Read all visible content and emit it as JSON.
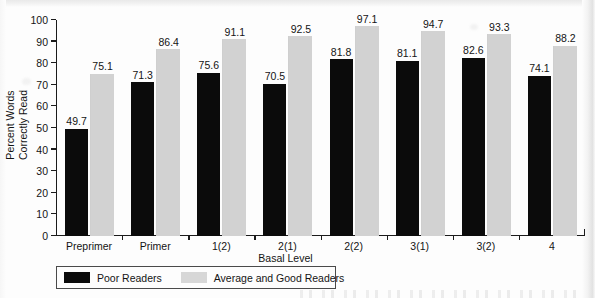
{
  "chart_data": {
    "type": "bar",
    "title": "",
    "subtitle": "",
    "xlabel": "Basal Level",
    "ylabel": "Percent Words Correctly Read",
    "ylabel_lines": [
      "Percent Words",
      "Correctly Read"
    ],
    "categories": [
      "Preprimer",
      "Primer",
      "1(2)",
      "2(1)",
      "2(2)",
      "3(1)",
      "3(2)",
      "4"
    ],
    "series": [
      {
        "name": "Poor Readers",
        "color": "#0b0b0b",
        "values": [
          49.7,
          71.3,
          75.6,
          70.5,
          81.8,
          81.1,
          82.6,
          74.1
        ],
        "labels": [
          "49.7",
          "71.3",
          "75.6",
          "70.5",
          "81.8",
          "81.1",
          "82.6",
          "74.1"
        ]
      },
      {
        "name": "Average and Good Readers",
        "color": "#d2d2d2",
        "values": [
          75.1,
          86.4,
          91.1,
          92.5,
          97.1,
          94.7,
          93.3,
          88.2
        ],
        "labels": [
          "75.1",
          "86.4",
          "91.1",
          "92.5",
          "97.1",
          "94.7",
          "93.3",
          "88.2"
        ]
      }
    ],
    "ylim": [
      0,
      100
    ],
    "ytick_values": [
      0,
      10,
      20,
      30,
      40,
      50,
      60,
      70,
      80,
      90,
      100
    ],
    "ytick_labels": [
      "0",
      "10",
      "20",
      "30",
      "40",
      "50",
      "60",
      "70",
      "80",
      "90",
      "100"
    ],
    "grid": false,
    "legend_position": "bottom-left",
    "legend_entries": [
      "Poor Readers",
      "Average and Good Readers"
    ]
  }
}
